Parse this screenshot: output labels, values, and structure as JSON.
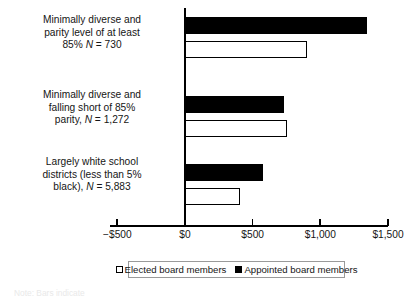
{
  "chart_data": {
    "type": "bar",
    "orientation": "horizontal",
    "title": "",
    "xlabel": "",
    "ylabel": "",
    "xlim": [
      -500,
      1500
    ],
    "xticks": [
      -500,
      0,
      500,
      1000,
      1500
    ],
    "xtick_labels": [
      "−$500",
      "$0",
      "$500",
      "$1,000",
      "$1,500"
    ],
    "grid": false,
    "legend_position": "bottom",
    "categories": [
      "Minimally diverse and parity level of at least 85% N = 730",
      "Minimally diverse and falling short of 85% parity, N = 1,272",
      "Largely white school districts (less than 5% black), N = 5,883"
    ],
    "category_labels": [
      {
        "line1": "Minimally diverse and",
        "line2": "parity level of at least",
        "line3_pre": "85% ",
        "line3_italic": "N",
        "line3_post": " = 730"
      },
      {
        "line1": "Minimally diverse and",
        "line2": "falling short of 85%",
        "line3_pre": "parity, ",
        "line3_italic": "N",
        "line3_post": " = 1,272"
      },
      {
        "line1": "Largely white school",
        "line2": "districts (less than 5%",
        "line3_pre": "black), ",
        "line3_italic": "N",
        "line3_post": " = 5,883"
      }
    ],
    "series": [
      {
        "name": "Appointed board members",
        "color": "#000000",
        "style": "filled",
        "values": [
          1345,
          730,
          575
        ]
      },
      {
        "name": "Elected board members",
        "color": "#ffffff",
        "style": "open",
        "values": [
          905,
          750,
          405
        ]
      }
    ]
  },
  "legend": {
    "entries": [
      {
        "label": "Elected board members",
        "swatch": "open"
      },
      {
        "label": "Appointed board members",
        "swatch": "filled"
      }
    ]
  },
  "footnote": {
    "text": "Note: Bars indicate"
  }
}
